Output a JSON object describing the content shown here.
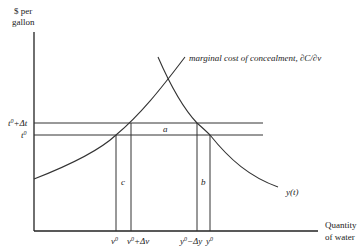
{
  "diagram": {
    "y_axis_label_line1": "$ per",
    "y_axis_label_line2": "gallon",
    "x_axis_label_line1": "Quantity",
    "x_axis_label_line2": "of water",
    "curves": {
      "marginal_cost": "marginal cost of concealment, ∂C/∂v",
      "supply": "y(t)"
    },
    "price_levels": [
      {
        "id": "t0_plus",
        "base": "t",
        "sup": "0",
        "suffix": "+Δt"
      },
      {
        "id": "t0",
        "base": "t",
        "sup": "0",
        "suffix": ""
      }
    ],
    "quantity_ticks": [
      {
        "id": "v0",
        "base": "v",
        "sup": "0",
        "suffix": ""
      },
      {
        "id": "v0_plus",
        "base": "v",
        "sup": "0",
        "suffix": "+Δv"
      },
      {
        "id": "y0_minus",
        "base": "y",
        "sup": "0",
        "suffix": "−Δy"
      },
      {
        "id": "y0",
        "base": "y",
        "sup": "0",
        "suffix": ""
      }
    ],
    "regions": {
      "a": "a",
      "b": "b",
      "c": "c"
    }
  }
}
